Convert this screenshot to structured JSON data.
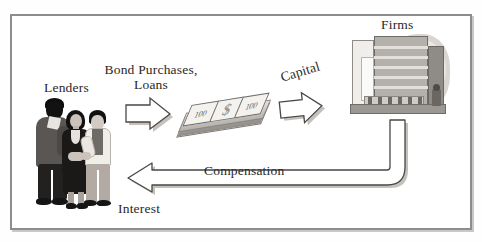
{
  "diagram": {
    "title_visible": false,
    "type": "circular-flow",
    "frame_color": "#8d8d8d",
    "background": "#ffffff"
  },
  "labels": {
    "lenders": "Lenders",
    "bond_purchases_line1": "Bond Purchases,",
    "bond_purchases_line2": "Loans",
    "capital": "Capital",
    "firms": "Firms",
    "compensation": "Compensation",
    "interest": "Interest"
  },
  "money": {
    "bill_left": "100",
    "bill_center": "$",
    "bill_right": "100"
  },
  "flows": [
    {
      "from": "Lenders",
      "to": "Money",
      "label": "Bond Purchases, Loans",
      "direction": "right"
    },
    {
      "from": "Money",
      "to": "Firms",
      "label": "Capital",
      "direction": "right"
    },
    {
      "from": "Firms",
      "to": "Lenders",
      "label": "Compensation",
      "direction": "left"
    },
    {
      "from": "Firms",
      "to": "Lenders",
      "label": "Interest",
      "direction": "left"
    }
  ],
  "colors": {
    "arrow_fill": "#ffffff",
    "arrow_stroke": "#4a4745",
    "arrow_shadow": "#bdbab6",
    "text": "#2b2725"
  }
}
